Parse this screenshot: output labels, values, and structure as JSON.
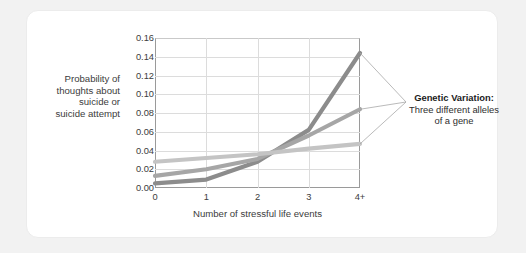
{
  "source_credit": "Data from Caspi et al. (2003)",
  "axes": {
    "ylabel_line1": "Probability of",
    "ylabel_line2": "thoughts about",
    "ylabel_line3": "suicide or",
    "ylabel_line4": "suicide attempt",
    "xlabel": "Number of stressful life events",
    "yticks": [
      "0.00",
      "0.02",
      "0.04",
      "0.06",
      "0.08",
      "0.10",
      "0.12",
      "0.14",
      "0.16"
    ],
    "xticks": [
      "0",
      "1",
      "2",
      "3",
      "4+"
    ]
  },
  "legend": {
    "title": "Genetic Variation:",
    "line2": "Three different alleles",
    "line3": "of a gene"
  },
  "colors": {
    "allele_dark": "#8c8c8c",
    "allele_medium": "#a6a6a6",
    "allele_light": "#c4c4c4",
    "grid": "#dcdcdc",
    "axis": "#9a9a9a",
    "card_bg": "#ffffff",
    "page_bg": "#f2f2f2",
    "text": "#3c3c3c"
  },
  "chart_data": {
    "type": "line",
    "title": "",
    "xlabel": "Number of stressful life events",
    "ylabel": "Probability of thoughts about suicide or suicide attempt",
    "x": [
      "0",
      "1",
      "2",
      "3",
      "4+"
    ],
    "xlim": [
      0,
      4
    ],
    "ylim": [
      0.0,
      0.16
    ],
    "ytick_step": 0.02,
    "grid": true,
    "legend_position": "right-callout",
    "series": [
      {
        "name": "Allele 1 (dark)",
        "color": "#8c8c8c",
        "values": [
          0.005,
          0.009,
          0.028,
          0.062,
          0.144
        ]
      },
      {
        "name": "Allele 2 (medium)",
        "color": "#a6a6a6",
        "values": [
          0.013,
          0.02,
          0.031,
          0.056,
          0.084
        ]
      },
      {
        "name": "Allele 3 (light)",
        "color": "#c4c4c4",
        "values": [
          0.028,
          0.032,
          0.036,
          0.042,
          0.047
        ]
      }
    ]
  }
}
